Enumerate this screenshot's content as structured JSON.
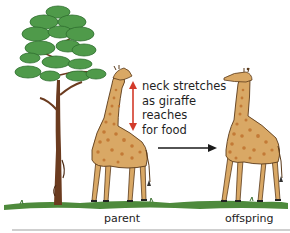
{
  "diagram": {
    "annotation_lines": [
      "neck stretches",
      "as giraffe",
      "reaches",
      "for food"
    ],
    "labels": {
      "parent": "parent",
      "offspring": "offspring"
    },
    "elements": [
      {
        "id": "tree",
        "type": "pine-tree"
      },
      {
        "id": "parent-giraffe",
        "type": "giraffe",
        "pose": "neck stretched up to tree"
      },
      {
        "id": "stretch-arrow",
        "type": "double-headed-arrow",
        "orientation": "vertical"
      },
      {
        "id": "inheritance-arrow",
        "type": "arrow",
        "direction": "right",
        "from": "parent",
        "to": "offspring"
      },
      {
        "id": "offspring-giraffe",
        "type": "giraffe",
        "pose": "long neck upright"
      },
      {
        "id": "ground",
        "type": "grass-strip"
      }
    ],
    "colors": {
      "foliage": "#4f9a4a",
      "foliage_dark": "#2f6e2f",
      "trunk": "#6b3b1f",
      "giraffe_body": "#d9a865",
      "giraffe_spots": "#c0722e",
      "giraffe_outline": "#5a3a1a",
      "stretch_arrow": "#d23a2a",
      "inheritance_arrow": "#1a1a1a",
      "ground": "#4e8a3c",
      "text": "#222222"
    }
  }
}
